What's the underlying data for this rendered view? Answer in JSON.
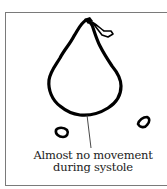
{
  "figure": {
    "caption_line1": "Almost no movement",
    "caption_line2": "during systole",
    "colors": {
      "outline": "#000000",
      "frame": "#7a7a7a",
      "text": "#222222",
      "background": "#ffffff"
    }
  }
}
